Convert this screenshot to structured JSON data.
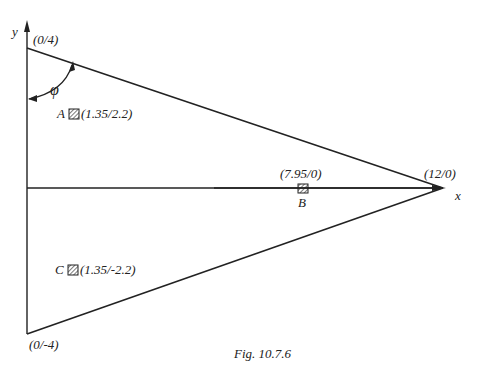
{
  "figure": {
    "caption": "Fig. 10.7.6",
    "axes": {
      "x_label": "x",
      "y_label": "y"
    },
    "angle_label": "φ",
    "vertices": [
      {
        "label": "(0/4)",
        "x": 0,
        "y": 4
      },
      {
        "label": "(12/0)",
        "x": 12,
        "y": 0
      },
      {
        "label": "(0/-4)",
        "x": 0,
        "y": -4
      }
    ],
    "points": [
      {
        "name": "A",
        "coord_label": "(1.35/2.2)",
        "x": 1.35,
        "y": 2.2
      },
      {
        "name": "B",
        "coord_label": "(7.95/0)",
        "x": 7.95,
        "y": 0
      },
      {
        "name": "C",
        "coord_label": "(1.35/-2.2)",
        "x": 1.35,
        "y": -2.2
      }
    ]
  }
}
